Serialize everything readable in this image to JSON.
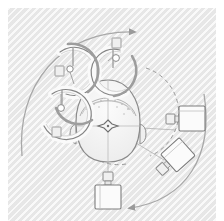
{
  "figure": {
    "background_color": "#e9e9e9",
    "page_color": "#ffffff",
    "line_color": "#8c8c8c",
    "dark_line_color": "#6e6e6e",
    "light_line_color": "#b8b8b8",
    "fill_color": "#f2f2f2",
    "hatch_pattern": "diagonal-45"
  },
  "subject": {
    "name": "head-top-view",
    "label": "",
    "center": {
      "x": 108,
      "y": 126
    },
    "cap_label": "",
    "fiducial_marker": "cross-star"
  },
  "arcs": [
    {
      "name": "coil-arc-upper-left",
      "cx": 72,
      "cy": 67,
      "r": 26,
      "start_deg": 150,
      "end_deg": 430
    },
    {
      "name": "coil-arc-upper-right",
      "cx": 120,
      "cy": 67,
      "r": 24,
      "start_deg": -60,
      "end_deg": 190
    },
    {
      "name": "coil-arc-lower-left",
      "cx": 63,
      "cy": 108,
      "r": 26,
      "start_deg": 110,
      "end_deg": 400
    }
  ],
  "rotation_arrows": [
    {
      "name": "rotation-arrow-top-left",
      "direction": "clockwise",
      "style": "solid"
    },
    {
      "name": "rotation-arrow-bottom-right",
      "direction": "counterclockwise",
      "style": "solid"
    }
  ],
  "tracking_circle": {
    "name": "tracking-orbit",
    "style": "dashed",
    "cx": 122,
    "cy": 112,
    "r": 45
  },
  "markers": [
    {
      "name": "square-marker-1",
      "x": 118,
      "y": 40,
      "type": "square"
    },
    {
      "name": "square-marker-2",
      "x": 59,
      "y": 68,
      "type": "square"
    },
    {
      "name": "square-marker-3",
      "x": 57,
      "y": 127,
      "type": "square"
    },
    {
      "name": "dot-marker-1",
      "x": 112,
      "y": 59,
      "type": "dot"
    },
    {
      "name": "dot-marker-2",
      "x": 75,
      "y": 71,
      "type": "dot"
    },
    {
      "name": "dot-marker-3",
      "x": 62,
      "y": 107,
      "type": "dot"
    }
  ],
  "cameras": [
    {
      "name": "camera-right-upper",
      "x": 178,
      "y": 121,
      "rotation_deg": 0,
      "label": ""
    },
    {
      "name": "camera-right-lower",
      "x": 167,
      "y": 157,
      "rotation_deg": -40,
      "label": ""
    },
    {
      "name": "camera-bottom",
      "x": 108,
      "y": 185,
      "rotation_deg": 0,
      "label": ""
    }
  ],
  "sight_lines": [
    {
      "name": "sightline-to-right-upper"
    },
    {
      "name": "sightline-to-right-lower"
    },
    {
      "name": "sightline-to-bottom"
    }
  ]
}
